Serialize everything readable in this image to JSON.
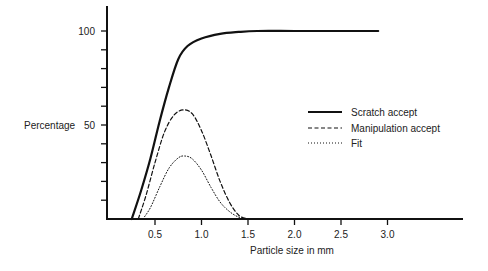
{
  "chart_data": {
    "type": "line",
    "title": "",
    "xlabel": "Particle size in mm",
    "ylabel": "Percentage",
    "xlim": [
      0,
      4.0
    ],
    "ylim": [
      0,
      115
    ],
    "x_ticks": [
      0.5,
      1.0,
      1.5,
      2.0,
      2.5,
      3.0
    ],
    "x_tick_labels": [
      "0.5",
      "1.0",
      "1.5",
      "2.0",
      "2.5",
      "3.0"
    ],
    "y_ticks": [
      10,
      20,
      30,
      40,
      50,
      60,
      70,
      80,
      90,
      100
    ],
    "y_tick_labels": {
      "50": "50",
      "100": "100"
    },
    "grid": false,
    "legend_position": "right-center",
    "series": [
      {
        "name": "Scratch accept",
        "style": "solid",
        "x": [
          0.25,
          0.35,
          0.45,
          0.55,
          0.65,
          0.75,
          0.85,
          1.0,
          1.2,
          1.4,
          1.6,
          2.0,
          2.5,
          2.9
        ],
        "y": [
          0,
          15,
          32,
          52,
          70,
          85,
          92,
          96,
          98.5,
          99.5,
          100,
          100,
          100,
          100
        ]
      },
      {
        "name": "Manipulation accept",
        "style": "dashed",
        "x": [
          0.32,
          0.4,
          0.5,
          0.6,
          0.7,
          0.8,
          0.9,
          1.0,
          1.1,
          1.2,
          1.3,
          1.4,
          1.5
        ],
        "y": [
          0,
          12,
          30,
          46,
          55,
          58,
          56,
          47,
          34,
          20,
          9,
          2,
          0
        ]
      },
      {
        "name": "Fit",
        "style": "dotted",
        "x": [
          0.37,
          0.45,
          0.55,
          0.65,
          0.75,
          0.82,
          0.9,
          1.0,
          1.1,
          1.2,
          1.3,
          1.4,
          1.5
        ],
        "y": [
          0,
          6,
          17,
          27,
          32.5,
          33.5,
          32,
          26,
          17,
          9,
          4,
          1,
          0
        ]
      }
    ]
  }
}
